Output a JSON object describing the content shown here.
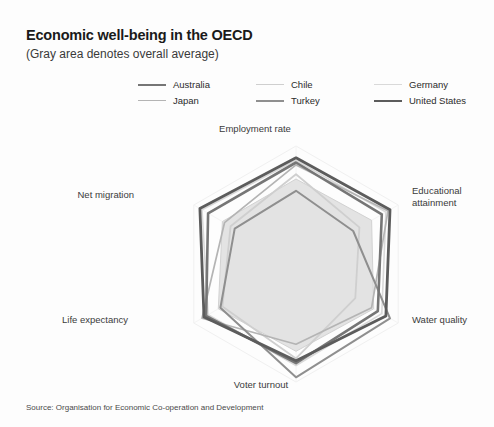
{
  "header": {
    "title": "Economic well-being in the OECD",
    "subtitle": "(Gray area denotes overall average)"
  },
  "source": "Source: Organisation for Economic Co-operation and Development",
  "legend": {
    "position": "top",
    "items": [
      {
        "label": "Australia",
        "color": "#767676",
        "width": 2.6
      },
      {
        "label": "Chile",
        "color": "#cfcfcf",
        "width": 1.8
      },
      {
        "label": "Germany",
        "color": "#d9d9d9",
        "width": 1.6
      },
      {
        "label": "Japan",
        "color": "#b4b4b4",
        "width": 1.7
      },
      {
        "label": "Turkey",
        "color": "#8f8f8f",
        "width": 2.0
      },
      {
        "label": "United States",
        "color": "#5c5c5c",
        "width": 2.8
      }
    ]
  },
  "chart_data": {
    "type": "radar",
    "title": "Economic well-being in the OECD",
    "subtitle": "(Gray area denotes overall average)",
    "categories": [
      "Employment rate",
      "Educational attainment",
      "Water quality",
      "Voter turnout",
      "Life expectancy",
      "Net migration"
    ],
    "rlim": [
      0,
      100
    ],
    "grid": false,
    "average_area": {
      "name": "Overall average",
      "values": [
        72,
        74,
        76,
        74,
        76,
        72
      ],
      "fill": "#e3e3e3",
      "stroke": "#d2d2d2"
    },
    "series": [
      {
        "name": "Australia",
        "color": "#767676",
        "width": 2.6,
        "values": [
          86,
          84,
          80,
          84,
          88,
          86
        ]
      },
      {
        "name": "Chile",
        "color": "#cfcfcf",
        "width": 1.8,
        "values": [
          76,
          62,
          58,
          80,
          72,
          64
        ]
      },
      {
        "name": "Germany",
        "color": "#d9d9d9",
        "width": 1.6,
        "values": [
          88,
          88,
          84,
          86,
          86,
          92
        ]
      },
      {
        "name": "Japan",
        "color": "#b4b4b4",
        "width": 1.7,
        "values": [
          84,
          90,
          74,
          68,
          92,
          70
        ]
      },
      {
        "name": "Turkey",
        "color": "#8f8f8f",
        "width": 2.0,
        "values": [
          62,
          56,
          92,
          96,
          74,
          60
        ]
      },
      {
        "name": "United States",
        "color": "#5c5c5c",
        "width": 2.8,
        "values": [
          90,
          92,
          88,
          82,
          90,
          94
        ]
      }
    ],
    "axis_label_positions": [
      {
        "label": "Employment rate",
        "left": 255,
        "top": 123,
        "anchor": "center"
      },
      {
        "label": "Educational attainment",
        "left": 412,
        "top": 185,
        "anchor": "left"
      },
      {
        "label": "Water quality",
        "left": 412,
        "top": 314,
        "anchor": "left"
      },
      {
        "label": "Voter turnout",
        "left": 261,
        "top": 379,
        "anchor": "center"
      },
      {
        "label": "Life expectancy",
        "left": 128,
        "top": 314,
        "anchor": "right"
      },
      {
        "label": "Net migration",
        "left": 134,
        "top": 189,
        "anchor": "right"
      }
    ]
  }
}
